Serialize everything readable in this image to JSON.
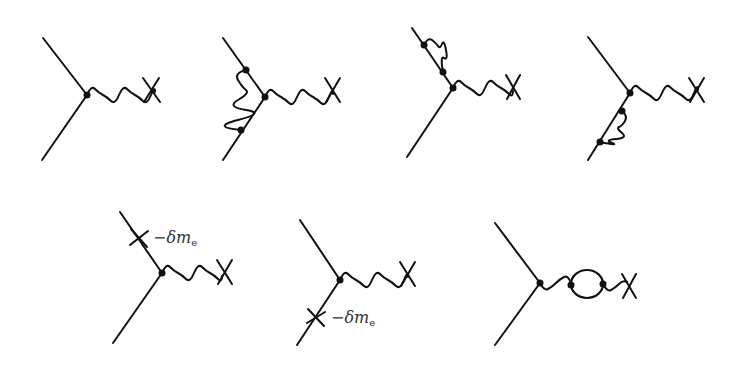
{
  "figure": {
    "background": "#ffffff",
    "ink": "#111111",
    "diagrams": [
      {
        "id": "tree",
        "label": ""
      },
      {
        "id": "vertex-correction",
        "label": ""
      },
      {
        "id": "self-energy-upper",
        "label": ""
      },
      {
        "id": "self-energy-lower",
        "label": ""
      },
      {
        "id": "mass-counterterm-upper",
        "label": "−δm",
        "label_sub": "e"
      },
      {
        "id": "mass-counterterm-lower",
        "label": "−δm",
        "label_sub": "e"
      },
      {
        "id": "vacuum-polarization",
        "label": ""
      }
    ]
  }
}
